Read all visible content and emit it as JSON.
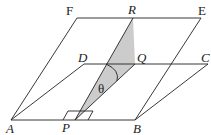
{
  "diagram": {
    "type": "geometry",
    "colors": {
      "line": "#222222",
      "shade": "#cccccc"
    },
    "points": {
      "A": {
        "label": "A",
        "italic": true
      },
      "B": {
        "label": "B",
        "italic": true
      },
      "C": {
        "label": "C",
        "italic": true
      },
      "D": {
        "label": "D",
        "italic": true
      },
      "E": {
        "label": "E",
        "italic": false
      },
      "F": {
        "label": "F",
        "italic": false
      },
      "P": {
        "label": "P",
        "italic": true
      },
      "Q": {
        "label": "Q",
        "italic": true
      },
      "R": {
        "label": "R",
        "italic": true
      }
    },
    "angle_label": "θ"
  }
}
